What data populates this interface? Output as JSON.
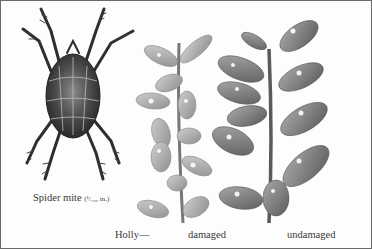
{
  "figure": {
    "captions": {
      "mite_label": "Spider mite",
      "mite_size": "(¹/₁₀₀ in.)",
      "plant_label": "Holly—",
      "damaged_label": "damaged",
      "undamaged_label": "undamaged"
    },
    "subjects": [
      "spider-mite-illustration",
      "holly-branch-damaged",
      "holly-branch-undamaged"
    ],
    "colors": {
      "border": "#6a6a6a",
      "background": "#fdfdfd",
      "ink": "#3a3a3a"
    }
  }
}
